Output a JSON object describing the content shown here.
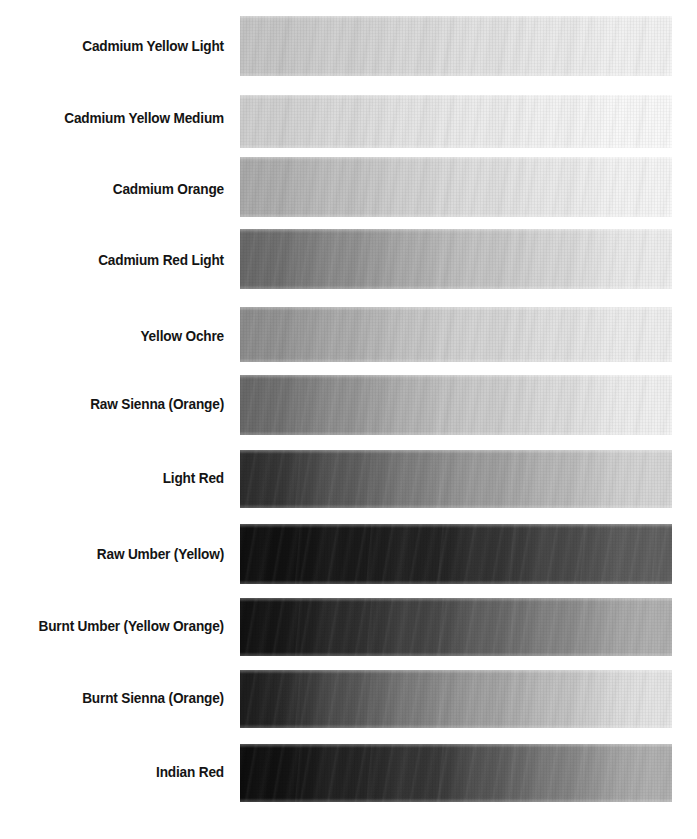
{
  "page": {
    "background_color": "#ffffff",
    "label_color": "#141414",
    "width": 697,
    "height": 839,
    "swatch_left": 240,
    "swatch_width": 432
  },
  "chart_data": {
    "type": "heatmap",
    "subtitle": "",
    "xlabel": "",
    "ylabel": "",
    "legend_position": "none",
    "grid": false,
    "x": [
      "mass tone (left)",
      "mid tint",
      "lightest tint (right)"
    ],
    "categories": [
      "Cadmium Yellow Light",
      "Cadmium Yellow Medium",
      "Cadmium Orange",
      "Cadmium Red Light",
      "Yellow Ochre",
      "Raw Sienna (Orange)",
      "Light Red",
      "Raw Umber (Yellow)",
      "Burnt Umber (Yellow Orange)",
      "Burnt Sienna (Orange)",
      "Indian Red"
    ],
    "series": [
      {
        "name": "left value (0=black, 255=white)",
        "values": [
          196,
          206,
          170,
          104,
          140,
          104,
          44,
          14,
          16,
          28,
          12
        ]
      },
      {
        "name": "mid value (0=black, 255=white)",
        "values": [
          221,
          232,
          216,
          184,
          205,
          192,
          140,
          36,
          74,
          140,
          58
        ]
      },
      {
        "name": "right value (0=black, 255=white)",
        "values": [
          243,
          250,
          246,
          238,
          239,
          241,
          214,
          96,
          176,
          229,
          176
        ]
      }
    ]
  },
  "rows": [
    {
      "label": "Cadmium Yellow Light",
      "swatch_name": "swatch-cadmium-yellow-light",
      "top": 16,
      "height": 60,
      "value_left": 196,
      "value_mid": 221,
      "value_right": 243,
      "hex_left": "#c4c4c4",
      "hex_mid": "#dddddd",
      "hex_right": "#f3f3f3",
      "label_top": 38
    },
    {
      "label": "Cadmium Yellow Medium",
      "swatch_name": "swatch-cadmium-yellow-medium",
      "top": 95,
      "height": 53,
      "value_left": 206,
      "value_mid": 232,
      "value_right": 250,
      "hex_left": "#cecece",
      "hex_mid": "#e8e8e8",
      "hex_right": "#fafafa",
      "label_top": 110
    },
    {
      "label": "Cadmium Orange",
      "swatch_name": "swatch-cadmium-orange",
      "top": 157,
      "height": 60,
      "value_left": 170,
      "value_mid": 216,
      "value_right": 246,
      "hex_left": "#aaaaaa",
      "hex_mid": "#d8d8d8",
      "hex_right": "#f6f6f6",
      "label_top": 181
    },
    {
      "label": "Cadmium Red Light",
      "swatch_name": "swatch-cadmium-red-light",
      "top": 229,
      "height": 60,
      "value_left": 104,
      "value_mid": 184,
      "value_right": 238,
      "hex_left": "#686868",
      "hex_mid": "#b8b8b8",
      "hex_right": "#eeeeee",
      "label_top": 252
    },
    {
      "label": "Yellow Ochre",
      "swatch_name": "swatch-yellow-ochre",
      "top": 307,
      "height": 55,
      "value_left": 140,
      "value_mid": 205,
      "value_right": 239,
      "hex_left": "#8c8c8c",
      "hex_mid": "#cdcdcd",
      "hex_right": "#efefef",
      "label_top": 328
    },
    {
      "label": "Raw Sienna (Orange)",
      "swatch_name": "swatch-raw-sienna-orange",
      "top": 375,
      "height": 60,
      "value_left": 104,
      "value_mid": 192,
      "value_right": 241,
      "hex_left": "#686868",
      "hex_mid": "#c0c0c0",
      "hex_right": "#f1f1f1",
      "label_top": 396
    },
    {
      "label": "Light Red",
      "swatch_name": "swatch-light-red",
      "top": 450,
      "height": 58,
      "value_left": 44,
      "value_mid": 140,
      "value_right": 214,
      "hex_left": "#2c2c2c",
      "hex_mid": "#8c8c8c",
      "hex_right": "#d6d6d6",
      "label_top": 470
    },
    {
      "label": "Raw Umber (Yellow)",
      "swatch_name": "swatch-raw-umber-yellow",
      "top": 524,
      "height": 60,
      "value_left": 14,
      "value_mid": 36,
      "value_right": 96,
      "hex_left": "#0e0e0e",
      "hex_mid": "#242424",
      "hex_right": "#606060",
      "label_top": 546
    },
    {
      "label": "Burnt Umber (Yellow Orange)",
      "swatch_name": "swatch-burnt-umber-yellow-orange",
      "top": 598,
      "height": 58,
      "value_left": 16,
      "value_mid": 74,
      "value_right": 176,
      "hex_left": "#101010",
      "hex_mid": "#4a4a4a",
      "hex_right": "#b0b0b0",
      "label_top": 618
    },
    {
      "label": "Burnt Sienna (Orange)",
      "swatch_name": "swatch-burnt-sienna-orange",
      "top": 670,
      "height": 58,
      "value_left": 28,
      "value_mid": 140,
      "value_right": 229,
      "hex_left": "#1c1c1c",
      "hex_mid": "#8c8c8c",
      "hex_right": "#e5e5e5",
      "label_top": 690
    },
    {
      "label": "Indian Red",
      "swatch_name": "swatch-indian-red",
      "top": 744,
      "height": 58,
      "value_left": 12,
      "value_mid": 58,
      "value_right": 176,
      "hex_left": "#0c0c0c",
      "hex_mid": "#3a3a3a",
      "hex_right": "#b0b0b0",
      "label_top": 764
    }
  ]
}
